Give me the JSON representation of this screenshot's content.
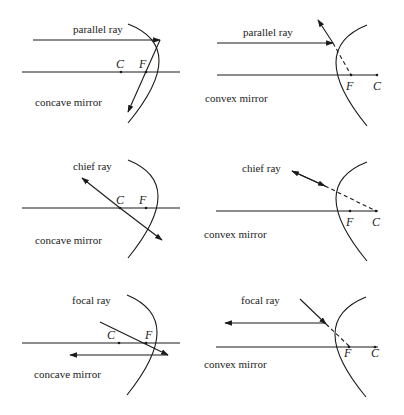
{
  "panels": [
    {
      "id": "concave-parallel",
      "ray_label": "parallel ray",
      "mirror_label": "concave mirror",
      "points": {
        "C": "C",
        "F": "F"
      }
    },
    {
      "id": "convex-parallel",
      "ray_label": "parallel ray",
      "mirror_label": "convex mirror",
      "points": {
        "F": "F",
        "C": "C"
      }
    },
    {
      "id": "concave-chief",
      "ray_label": "chief ray",
      "mirror_label": "concave mirror",
      "points": {
        "C": "C",
        "F": "F"
      }
    },
    {
      "id": "convex-chief",
      "ray_label": "chief ray",
      "mirror_label": "convex mirror",
      "points": {
        "F": "F",
        "C": "C"
      }
    },
    {
      "id": "concave-focal",
      "ray_label": "focal ray",
      "mirror_label": "concave mirror",
      "points": {
        "C": "C",
        "F": "F"
      }
    },
    {
      "id": "convex-focal",
      "ray_label": "focal ray",
      "mirror_label": "convex mirror",
      "points": {
        "F": "F",
        "C": "C"
      }
    }
  ],
  "colors": {
    "ink": "#1a1a1a",
    "background": "#ffffff"
  }
}
